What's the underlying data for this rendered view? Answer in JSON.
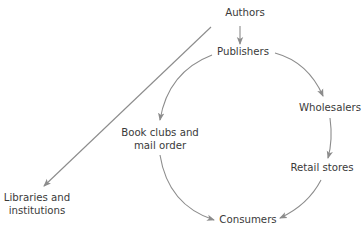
{
  "diagram": {
    "type": "flow",
    "edge_color": "#8c8c8c",
    "text_color": "#3a3a3a",
    "nodes": {
      "authors": {
        "label": "Authors"
      },
      "publishers": {
        "label": "Publishers"
      },
      "wholesalers": {
        "label": "Wholesalers"
      },
      "retail_stores": {
        "label": "Retail stores"
      },
      "book_clubs": {
        "line1": "Book clubs and",
        "line2": "mail order"
      },
      "libraries": {
        "line1": "Libraries and",
        "line2": "institutions"
      },
      "consumers": {
        "label": "Consumers"
      }
    },
    "edges": [
      {
        "from": "Authors",
        "to": "Publishers"
      },
      {
        "from": "Authors",
        "to": "Libraries and institutions"
      },
      {
        "from": "Publishers",
        "to": "Wholesalers"
      },
      {
        "from": "Publishers",
        "to": "Book clubs and mail order"
      },
      {
        "from": "Wholesalers",
        "to": "Retail stores"
      },
      {
        "from": "Retail stores",
        "to": "Consumers"
      },
      {
        "from": "Book clubs and mail order",
        "to": "Consumers"
      }
    ]
  }
}
